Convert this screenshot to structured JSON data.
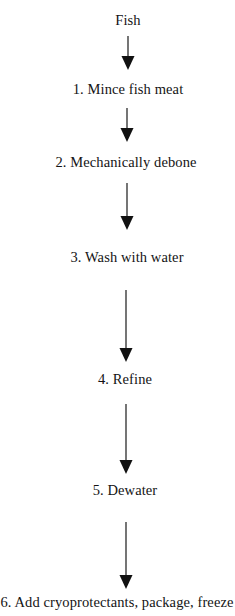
{
  "diagram": {
    "type": "flowchart",
    "orientation": "vertical-top-down",
    "background_color": "#ffffff",
    "text_color": "#141414",
    "arrow_color": "#111111",
    "nodes": [
      {
        "id": "node-start",
        "label": "Fish",
        "step_number": null,
        "center_x": 128,
        "top": 13,
        "font_size": 14.5
      },
      {
        "id": "node-step-1",
        "label": "1. Mince fish meat",
        "step_number": 1,
        "center_x": 128,
        "top": 82,
        "font_size": 14.5
      },
      {
        "id": "node-step-2",
        "label": "2. Mechanically debone",
        "step_number": 2,
        "center_x": 126,
        "top": 155,
        "font_size": 14.5
      },
      {
        "id": "node-step-3",
        "label": "3. Wash with water",
        "step_number": 3,
        "center_x": 127,
        "top": 250,
        "font_size": 14.5
      },
      {
        "id": "node-step-4",
        "label": "4. Refine",
        "step_number": 4,
        "center_x": 125,
        "top": 372,
        "font_size": 14.5
      },
      {
        "id": "node-step-5",
        "label": "5. Dewater",
        "step_number": 5,
        "center_x": 125,
        "top": 483,
        "font_size": 14.5
      },
      {
        "id": "node-step-6",
        "label": "6. Add cryoprotectants, package, freeze",
        "step_number": 6,
        "center_x": 117,
        "top": 595,
        "font_size": 14.5
      }
    ],
    "arrows": [
      {
        "id": "arrow-1",
        "from": "node-start",
        "to": "node-step-1",
        "x": 128,
        "y_start": 36,
        "y_end": 70
      },
      {
        "id": "arrow-2",
        "from": "node-step-1",
        "to": "node-step-2",
        "x": 127,
        "y_start": 108,
        "y_end": 142
      },
      {
        "id": "arrow-3",
        "from": "node-step-2",
        "to": "node-step-3",
        "x": 127,
        "y_start": 183,
        "y_end": 230
      },
      {
        "id": "arrow-4",
        "from": "node-step-3",
        "to": "node-step-4",
        "x": 126,
        "y_start": 290,
        "y_end": 362
      },
      {
        "id": "arrow-5",
        "from": "node-step-4",
        "to": "node-step-5",
        "x": 126,
        "y_start": 404,
        "y_end": 474
      },
      {
        "id": "arrow-6",
        "from": "node-step-5",
        "to": "node-step-6",
        "x": 126,
        "y_start": 522,
        "y_end": 589
      }
    ]
  }
}
